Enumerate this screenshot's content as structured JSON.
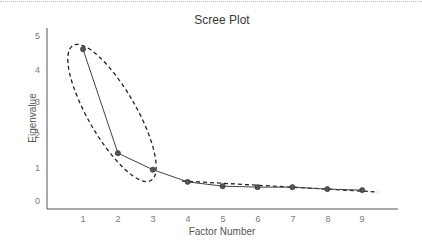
{
  "chart_data": {
    "type": "line",
    "title": "Scree Plot",
    "xlabel": "Factor Number",
    "ylabel": "Eigenvalue",
    "x": [
      1,
      2,
      3,
      4,
      5,
      6,
      7,
      8,
      9
    ],
    "values": [
      4.6,
      1.45,
      0.95,
      0.58,
      0.45,
      0.42,
      0.42,
      0.36,
      0.33
    ],
    "xticks": [
      "1",
      "2",
      "3",
      "4",
      "5",
      "6",
      "7",
      "8",
      "9"
    ],
    "yticks": [
      "0",
      "1",
      "2",
      "3",
      "4",
      "5"
    ],
    "ylim": [
      0,
      5
    ],
    "xlim": [
      0,
      10
    ],
    "grid": false,
    "legend": null,
    "annotations": [
      {
        "type": "dashed-ellipse",
        "description": "Encircles factors 1-3 (steep portion)"
      },
      {
        "type": "dashed-line",
        "description": "Trend line through factors 4-9 (flat scree)"
      }
    ]
  },
  "colors": {
    "line": "#444444",
    "marker": "#555555",
    "axis": "#555555",
    "annotation": "#222222"
  }
}
